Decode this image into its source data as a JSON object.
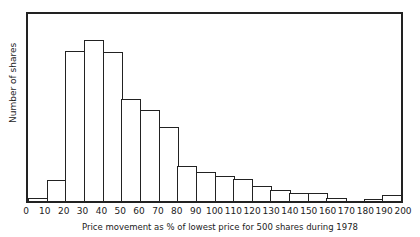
{
  "chart_data": {
    "type": "bar",
    "title": "",
    "xlabel": "Price movement as % of lowest price for 500 shares during 1978",
    "ylabel": "Number of shares",
    "categories": [
      "0-10",
      "10-20",
      "20-30",
      "30-40",
      "40-50",
      "50-60",
      "60-70",
      "70-80",
      "80-90",
      "90-100",
      "100-110",
      "110-120",
      "120-130",
      "130-140",
      "140-150",
      "150-160",
      "160-170",
      "170-180",
      "180-190",
      "190-200"
    ],
    "values": [
      3,
      21,
      152,
      164,
      151,
      104,
      92,
      75,
      36,
      29,
      25,
      22,
      15,
      11,
      8,
      8,
      3,
      0,
      2,
      6
    ],
    "x_ticks": [
      "0",
      "10",
      "20",
      "30",
      "40",
      "50",
      "60",
      "70",
      "80",
      "90",
      "100",
      "110",
      "120",
      "130",
      "140",
      "150",
      "160",
      "170",
      "180",
      "190",
      "200"
    ],
    "xlim": [
      0,
      200
    ],
    "ylim": [
      0,
      190
    ],
    "grid": false,
    "legend": "none",
    "y_units": "relative (no y tick labels shown)"
  }
}
